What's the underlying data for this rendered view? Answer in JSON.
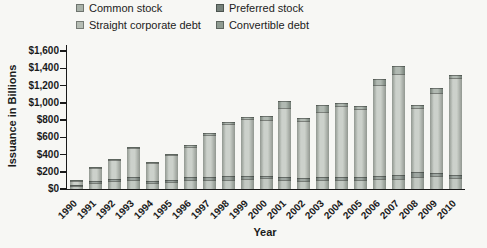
{
  "chart_data": {
    "type": "bar",
    "stacked": true,
    "title": "",
    "xlabel": "Year",
    "ylabel": "Issuance in Billions",
    "ylim": [
      0,
      1600
    ],
    "ytick_step": 200,
    "ytick_labels": [
      "$0",
      "$200",
      "$400",
      "$600",
      "$800",
      "$1,000",
      "$1,200",
      "$1,400",
      "$1,600"
    ],
    "grid": false,
    "legend_position": "top",
    "categories": [
      "1990",
      "1991",
      "1992",
      "1993",
      "1994",
      "1995",
      "1996",
      "1997",
      "1998",
      "1999",
      "2000",
      "2001",
      "2002",
      "2003",
      "2004",
      "2005",
      "2006",
      "2007",
      "2008",
      "2009",
      "2010"
    ],
    "series": [
      {
        "name": "Common stock",
        "color": "#a9b2a9",
        "values": [
          40,
          75,
          90,
          105,
          65,
          85,
          105,
          105,
          110,
          120,
          130,
          100,
          95,
          100,
          105,
          110,
          115,
          120,
          140,
          150,
          130
        ]
      },
      {
        "name": "Preferred stock",
        "color": "#76817a",
        "values": [
          10,
          20,
          30,
          35,
          25,
          25,
          35,
          40,
          40,
          35,
          25,
          35,
          35,
          35,
          35,
          30,
          35,
          45,
          60,
          30,
          35
        ]
      },
      {
        "name": "Straight corporate debt",
        "color": "#b6bdb4",
        "values": [
          45,
          145,
          215,
          330,
          210,
          280,
          350,
          480,
          600,
          660,
          645,
          810,
          660,
          760,
          825,
          790,
          1060,
          1170,
          740,
          930,
          1120
        ]
      },
      {
        "name": "Convertible debt",
        "color": "#8f9b91",
        "values": [
          5,
          10,
          15,
          10,
          10,
          10,
          20,
          25,
          25,
          25,
          50,
          75,
          30,
          75,
          35,
          30,
          70,
          95,
          35,
          60,
          35
        ]
      }
    ],
    "totals": [
      100,
      250,
      350,
      480,
      310,
      400,
      510,
      650,
      775,
      840,
      850,
      1020,
      820,
      970,
      1000,
      960,
      1280,
      1430,
      975,
      1170,
      1320
    ]
  }
}
